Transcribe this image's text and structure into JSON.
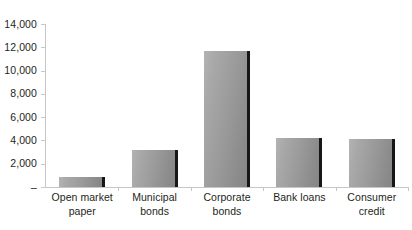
{
  "chart_data": {
    "type": "bar",
    "title": "",
    "subtitle": "",
    "xlabel": "",
    "ylabel": "",
    "categories": [
      "Open market paper",
      "Municipal bonds",
      "Corporate bonds",
      "Bank loans",
      "Consumer credit"
    ],
    "values": [
      900,
      3150,
      11700,
      4200,
      4150
    ],
    "series": [
      {
        "name": "",
        "values": [
          900,
          3150,
          11700,
          4200,
          4150
        ]
      }
    ],
    "ylim": [
      0,
      14000
    ],
    "ytick_values": [
      0,
      2000,
      4000,
      6000,
      8000,
      10000,
      12000,
      14000
    ],
    "ytick_labels": [
      "–",
      "2,000",
      "4,000",
      "6,000",
      "8,000",
      "10,000",
      "12,000",
      "14,000"
    ],
    "grid": false,
    "legend": false,
    "legend_position": "none",
    "bar_color": "#9a9a9a",
    "bar_edge_color": "#17171a",
    "axis_color": "#c6c6c6",
    "text_color": "#231f20",
    "background_color": "#ffffff"
  },
  "axis": {
    "y_labels": [
      {
        "text": "14,000",
        "value": 14000
      },
      {
        "text": "12,000",
        "value": 12000
      },
      {
        "text": "10,000",
        "value": 10000
      },
      {
        "text": "8,000",
        "value": 8000
      },
      {
        "text": "6,000",
        "value": 6000
      },
      {
        "text": "4,000",
        "value": 4000
      },
      {
        "text": "2,000",
        "value": 2000
      },
      {
        "text": "–",
        "value": 0
      }
    ],
    "x_labels": [
      {
        "line1": "Open market",
        "line2": "paper"
      },
      {
        "line1": "Municipal",
        "line2": "bonds"
      },
      {
        "line1": "Corporate",
        "line2": "bonds"
      },
      {
        "line1": "Bank loans",
        "line2": ""
      },
      {
        "line1": "Consumer",
        "line2": "credit"
      }
    ]
  }
}
